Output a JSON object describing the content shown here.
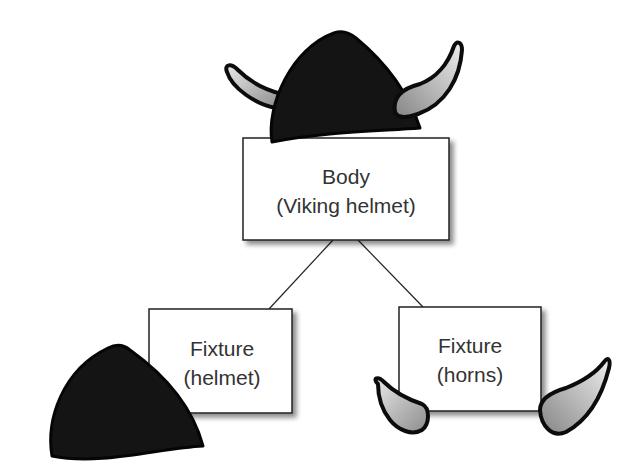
{
  "diagram": {
    "nodes": {
      "body": {
        "title": "Body",
        "subtitle": "(Viking helmet)"
      },
      "fixture_helmet": {
        "title": "Fixture",
        "subtitle": "(helmet)"
      },
      "fixture_horns": {
        "title": "Fixture",
        "subtitle": "(horns)"
      }
    },
    "edges": [
      {
        "from": "body",
        "to": "fixture_helmet"
      },
      {
        "from": "body",
        "to": "fixture_horns"
      }
    ],
    "colors": {
      "helmet_fill": "#141414",
      "horn_light": "#e6e6e6",
      "horn_dark": "#8a8a8a",
      "box_border": "#222222",
      "text": "#333333"
    }
  }
}
